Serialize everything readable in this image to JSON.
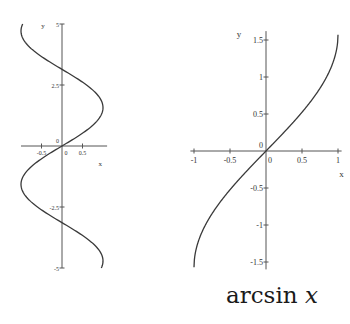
{
  "caption": {
    "func": "arcsin",
    "var": "x"
  },
  "colors": {
    "curve": "#3a3a3a",
    "axis": "#555555",
    "text": "#333333",
    "background": "#ffffff"
  },
  "chart_data": [
    {
      "type": "line",
      "title": "",
      "description": "Graph of x = sin(y) (inverse relation of sine), plotted for y in [-5, 5]",
      "xlabel": "x",
      "ylabel": "y",
      "xlim": [
        -1,
        1
      ],
      "ylim": [
        -5,
        5
      ],
      "x_ticks": [
        -0.5,
        0,
        0.5
      ],
      "x_tick_labels": [
        "-0.5",
        "0",
        "0.5"
      ],
      "y_ticks": [
        -5,
        -2.5,
        2.5,
        5
      ],
      "y_tick_labels": [
        "-5",
        "-2.5",
        "2.5",
        "5"
      ],
      "origin_label": "0",
      "grid": false,
      "series": [
        {
          "name": "x = sin(y)",
          "points": [
            {
              "x": 0.959,
              "y": -5
            },
            {
              "x": 0.351,
              "y": -3.5
            },
            {
              "x": 0,
              "y": -3.14
            },
            {
              "x": -0.598,
              "y": -2.5
            },
            {
              "x": -1,
              "y": -1.57
            },
            {
              "x": -0.479,
              "y": -0.5
            },
            {
              "x": 0,
              "y": 0
            },
            {
              "x": 0.479,
              "y": 0.5
            },
            {
              "x": 1,
              "y": 1.57
            },
            {
              "x": 0.598,
              "y": 2.5
            },
            {
              "x": 0,
              "y": 3.14
            },
            {
              "x": -0.351,
              "y": 3.5
            },
            {
              "x": -0.959,
              "y": 5
            }
          ]
        }
      ],
      "frame": {
        "ox": 62,
        "oy": 146,
        "px_per_x": 41,
        "px_per_y": 24.4,
        "x_axis_from": -1.0,
        "x_axis_to": 1.1,
        "y_axis_from": -5,
        "y_axis_to": 5
      }
    },
    {
      "type": "line",
      "title": "arcsin x",
      "xlabel": "x",
      "ylabel": "y",
      "xlim": [
        -1,
        1
      ],
      "ylim": [
        -1.5708,
        1.5708
      ],
      "x_ticks": [
        -1,
        -0.5,
        0,
        0.5,
        1
      ],
      "x_tick_labels": [
        "-1",
        "-0.5",
        "0",
        "0.5",
        "1"
      ],
      "y_ticks": [
        -1.5,
        -1,
        -0.5,
        0.5,
        1,
        1.5
      ],
      "y_tick_labels": [
        "-1.5",
        "-1",
        "-0.5",
        "0.5",
        "1",
        "1.5"
      ],
      "origin_label": "0",
      "grid": false,
      "series": [
        {
          "name": "y = arcsin(x)",
          "points": [
            {
              "x": -1,
              "y": -1.571
            },
            {
              "x": -0.9,
              "y": -1.12
            },
            {
              "x": -0.75,
              "y": -0.848
            },
            {
              "x": -0.5,
              "y": -0.524
            },
            {
              "x": -0.25,
              "y": -0.253
            },
            {
              "x": 0,
              "y": 0
            },
            {
              "x": 0.25,
              "y": 0.253
            },
            {
              "x": 0.5,
              "y": 0.524
            },
            {
              "x": 0.75,
              "y": 0.848
            },
            {
              "x": 0.9,
              "y": 1.12
            },
            {
              "x": 1,
              "y": 1.571
            }
          ]
        }
      ],
      "frame": {
        "ox": 266,
        "oy": 151,
        "px_per_x": 72,
        "px_per_y": 74,
        "x_axis_from": -1.05,
        "x_axis_to": 1.05,
        "y_axis_from": -1.6,
        "y_axis_to": 1.62
      }
    }
  ]
}
